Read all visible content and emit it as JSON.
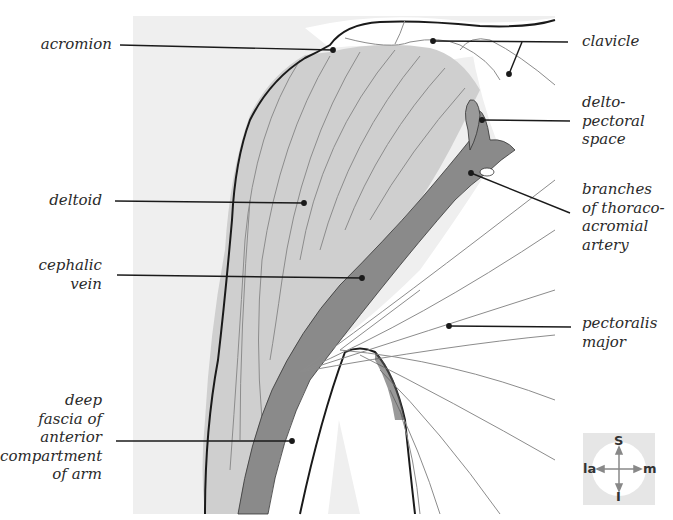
{
  "figure": {
    "colors": {
      "background_panel": "#efefef",
      "deltoid_fill": "#cfcfcf",
      "cephalic_vein_fill": "#8a8a8a",
      "outline": "#1a1a1a",
      "fiber_lines": "#8c8c8c",
      "leader_lines": "#1a1a1a",
      "label_text": "#2a2a2a"
    }
  },
  "labels": {
    "left": [
      {
        "id": "acromion",
        "text": "acromion"
      },
      {
        "id": "deltoid",
        "text": "deltoid"
      },
      {
        "id": "cephalic_vein",
        "text": "cephalic\nvein"
      },
      {
        "id": "deep_fascia",
        "text": "deep\nfascia of\nanterior\ncompartment\nof arm"
      }
    ],
    "right": [
      {
        "id": "clavicle",
        "text": "clavicle"
      },
      {
        "id": "deltopectoral_space",
        "text": "delto-\npectoral\nspace"
      },
      {
        "id": "thoracoacromial_branches",
        "text": "branches\nof thoraco-\nacromial\nartery"
      },
      {
        "id": "pectoralis_major",
        "text": "pectoralis\nmajor"
      }
    ]
  },
  "orientation_compass": {
    "top": "S",
    "bottom": "I",
    "left": "la",
    "right": "m"
  }
}
